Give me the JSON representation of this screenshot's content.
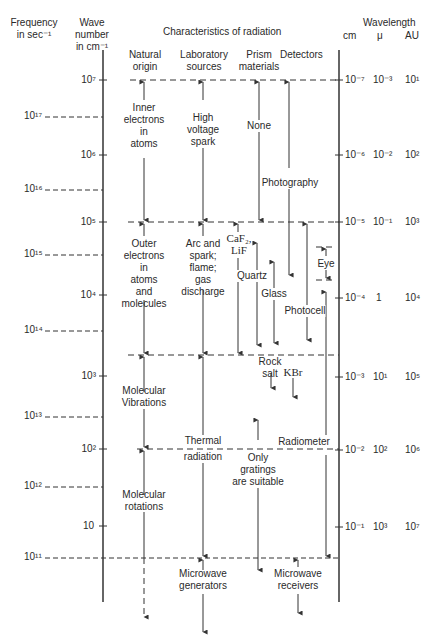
{
  "header": {
    "frequency": "Frequency\nin sec⁻¹",
    "wave_number": "Wave\nnumber\nin cm⁻¹",
    "characteristics": "Characteristics of radiation",
    "wavelength": "Wavelength",
    "cm": "cm",
    "mu": "μ",
    "au": "AU",
    "columns": {
      "natural": "Natural\norigin",
      "laboratory": "Laboratory\nsources",
      "prism": "Prism\nmaterials",
      "detectors": "Detectors"
    }
  },
  "frequency_ticks": [
    "10¹⁷",
    "10¹⁶",
    "10¹⁵",
    "10¹⁴",
    "10¹³",
    "10¹²",
    "10¹¹"
  ],
  "wavenumber_ticks": [
    "10⁷",
    "10⁶",
    "10⁵",
    "10⁴",
    "10³",
    "10²",
    "10"
  ],
  "wavelength_rows": [
    {
      "cm": "10⁻⁷",
      "mu": "10⁻³",
      "au": "10¹"
    },
    {
      "cm": "10⁻⁶",
      "mu": "10⁻²",
      "au": "10²"
    },
    {
      "cm": "10⁻⁵",
      "mu": "10⁻¹",
      "au": "10³"
    },
    {
      "cm": "10⁻⁴",
      "mu": "1",
      "au": "10⁴"
    },
    {
      "cm": "10⁻³",
      "mu": "10¹",
      "au": "10⁵"
    },
    {
      "cm": "10⁻²",
      "mu": "10²",
      "au": "10⁶"
    },
    {
      "cm": "10⁻¹",
      "mu": "10³",
      "au": "10⁷"
    }
  ],
  "natural_origin": {
    "inner": "Inner\nelectrons\nin\natoms",
    "outer": "Outer\nelectrons\nin\natoms\nand\nmolecules",
    "vibrations": "Molecular\nVibrations",
    "rotations": "Molecular\nrotations"
  },
  "laboratory_sources": {
    "spark": "High\nvoltage\nspark",
    "arc": "Arc and\nspark;\nflame;\ngas\ndischarge",
    "thermal": "Thermal",
    "radiation": "radiation",
    "microwave": "Microwave\ngenerators"
  },
  "prism_materials": {
    "none": "None",
    "caf2": "CaF₂,\nLiF",
    "quartz": "Quartz",
    "glass": "Glass",
    "rocksalt": "Rock\nsalt",
    "kbr": "KBr",
    "gratings": "Only\ngratings\nare suitable"
  },
  "detectors": {
    "photography": "Photography",
    "eye": "Eye",
    "photocell": "Photocell",
    "radiometer": "Radiometer",
    "microwave": "Microwave\nreceivers"
  }
}
